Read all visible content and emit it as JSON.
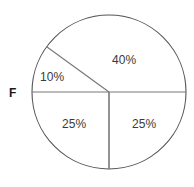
{
  "figure": {
    "background_color": "#ffffff",
    "width": 194,
    "height": 187,
    "outline_color": "#555555",
    "divider_color": "#777777",
    "label_color": "#3a3a3a",
    "axis_label_color": "#1a1a1a"
  },
  "marker": {
    "label": "F"
  },
  "chart_data": {
    "type": "pie",
    "title": "",
    "xlabel": "",
    "ylabel": "",
    "legend": "none",
    "grid": false,
    "filled": false,
    "center": {
      "x": 109,
      "y": 92
    },
    "radius": 77,
    "start_angle_deg": 180,
    "direction": "clockwise",
    "categories": [
      "40%",
      "25%",
      "25%",
      "10%"
    ],
    "values": [
      40,
      25,
      25,
      10
    ],
    "units": "percent",
    "annotations": [
      "F"
    ],
    "slices": [
      {
        "label": "10%",
        "value": 10,
        "sweep_deg": 36,
        "start_deg": 180,
        "end_deg": 144,
        "fill": "none",
        "label_x": 40,
        "label_y": 71
      },
      {
        "label": "40%",
        "value": 40,
        "sweep_deg": 144,
        "start_deg": 144,
        "end_deg": 0,
        "fill": "none",
        "label_x": 112,
        "label_y": 54
      },
      {
        "label": "25%",
        "value": 25,
        "sweep_deg": 90,
        "start_deg": 0,
        "end_deg": 270,
        "fill": "none",
        "label_x": 132,
        "label_y": 118
      },
      {
        "label": "25%",
        "value": 25,
        "sweep_deg": 90,
        "start_deg": 270,
        "end_deg": 180,
        "fill": "none",
        "label_x": 62,
        "label_y": 118
      }
    ]
  }
}
